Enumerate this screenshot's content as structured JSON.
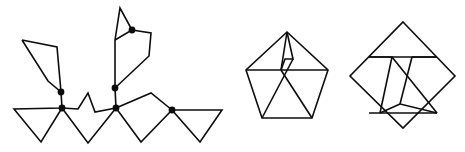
{
  "canvas": {
    "width": 465,
    "height": 152,
    "background": "#ffffff",
    "stroke_color": "#0d0d0d",
    "vertex_color": "#0d0d0d",
    "stroke_width": 1.6,
    "vertex_radius": 3.4
  },
  "figures": [
    {
      "id": "figure-left",
      "name": "branching-polyline-figure",
      "description": "open polyline tree with five marked junction vertices",
      "polylines": [
        {
          "name": "left-upper-spike",
          "closed": false,
          "points": "22,40 48,81 61,92 57,47 22,40"
        },
        {
          "name": "left-lower-wing",
          "closed": false,
          "points": "61,92 62,108 14,109 41,142 62,108"
        },
        {
          "name": "center-zigzag-and-baseline",
          "closed": false,
          "points": "62,108 78,109 88,93 95,112 116,108"
        },
        {
          "name": "lower-center-v",
          "closed": false,
          "points": "62,108 88,143 116,108"
        },
        {
          "name": "middle-vertical-stem",
          "closed": false,
          "points": "116,108 115,88 115,40"
        },
        {
          "name": "upper-spike-left",
          "closed": false,
          "points": "115,40 120,8 132,30 115,40"
        },
        {
          "name": "upper-right-hook",
          "closed": false,
          "points": "132,30 151,33 149,56 115,88"
        },
        {
          "name": "right-branch",
          "closed": false,
          "points": "116,108 151,93 172,110"
        },
        {
          "name": "right-lower-v",
          "closed": false,
          "points": "116,108 141,142 172,110"
        },
        {
          "name": "right-triangle",
          "closed": true,
          "points": "172,110 222,110 200,142"
        }
      ],
      "vertices": [
        {
          "name": "vertex-upper-left-junction",
          "x": 61,
          "y": 92
        },
        {
          "name": "vertex-lower-left-junction",
          "x": 62,
          "y": 108
        },
        {
          "name": "vertex-middle-upper-junction",
          "x": 115,
          "y": 88
        },
        {
          "name": "vertex-middle-lower-junction",
          "x": 116,
          "y": 108
        },
        {
          "name": "vertex-top-spike-junction",
          "x": 132,
          "y": 30
        },
        {
          "name": "vertex-right-junction",
          "x": 172,
          "y": 110
        }
      ]
    },
    {
      "id": "figure-middle",
      "name": "pentagon-with-inner-lines-figure",
      "description": "regular pentagon containing crossing internal chords and a small inner notch",
      "polylines": [
        {
          "name": "pentagon-outline",
          "closed": true,
          "points": "287,32 328,70 312,118 262,118 246,70"
        },
        {
          "name": "inner-horizontal-chord",
          "closed": false,
          "points": "246,70 328,70"
        },
        {
          "name": "inner-notch-left",
          "closed": false,
          "points": "287,32 281,70"
        },
        {
          "name": "inner-notch-apex",
          "closed": false,
          "points": "287,32 293,59 285,59 281,70"
        },
        {
          "name": "inner-cross-left",
          "closed": false,
          "points": "281,70 312,118"
        },
        {
          "name": "inner-cross-right",
          "closed": false,
          "points": "293,59 262,118"
        }
      ],
      "vertices": []
    },
    {
      "id": "figure-right",
      "name": "diamond-with-inner-lines-figure",
      "description": "square rotated 45 degrees containing an inner M-shaped polyline and base triangle",
      "polylines": [
        {
          "name": "diamond-outline",
          "closed": true,
          "points": "403,22 455,76 403,128 350,76"
        },
        {
          "name": "inner-top-horizontal",
          "closed": false,
          "points": "369,57 437,57"
        },
        {
          "name": "inner-base-horizontal",
          "closed": false,
          "points": "369,113 437,113"
        },
        {
          "name": "inner-left-peak",
          "closed": false,
          "points": "369,57 392,57 380,113"
        },
        {
          "name": "inner-center-peak",
          "closed": false,
          "points": "392,57 437,113"
        },
        {
          "name": "inner-right-peak",
          "closed": false,
          "points": "412,57 437,57"
        },
        {
          "name": "inner-right-leg",
          "closed": false,
          "points": "412,57 400,104 437,113"
        },
        {
          "name": "inner-base-triangle",
          "closed": false,
          "points": "400,104 380,113"
        }
      ],
      "vertices": []
    }
  ]
}
